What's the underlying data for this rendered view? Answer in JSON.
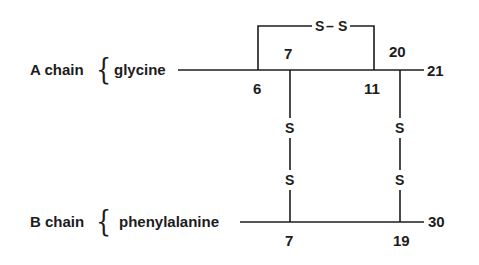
{
  "diagram": {
    "a_chain": {
      "label": "A chain",
      "brace": "{",
      "n_terminal_residue": "glycine",
      "positions": {
        "p6": "6",
        "p7": "7",
        "p11": "11",
        "p20": "20",
        "p21": "21"
      },
      "intrachain_bond": {
        "s1": "S",
        "dash": "–",
        "s2": "S"
      }
    },
    "b_chain": {
      "label": "B chain",
      "brace": "{",
      "n_terminal_residue": "phenylalanine",
      "positions": {
        "p7": "7",
        "p19": "19",
        "p30": "30"
      }
    },
    "interchain_bonds": [
      {
        "from": "A7",
        "to": "B7",
        "s_top": "S",
        "s_bottom": "S"
      },
      {
        "from": "A20",
        "to": "B19",
        "s_top": "S",
        "s_bottom": "S"
      }
    ],
    "line_color": "#1c1c1c"
  }
}
